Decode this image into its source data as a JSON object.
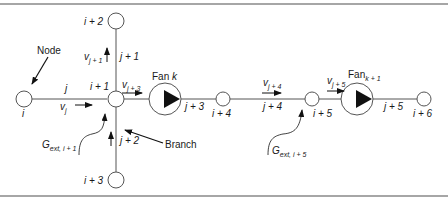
{
  "diagram": {
    "nodes": [
      {
        "id": "i",
        "label": "i"
      },
      {
        "id": "i+1",
        "label": "i + 1"
      },
      {
        "id": "i+2",
        "label": "i + 2"
      },
      {
        "id": "i+3",
        "label": "i + 3"
      },
      {
        "id": "i+4",
        "label": "i + 4"
      },
      {
        "id": "i+5",
        "label": "i + 5"
      },
      {
        "id": "i+6",
        "label": "i + 6"
      }
    ],
    "branches": [
      {
        "id": "j",
        "label": "j"
      },
      {
        "id": "j+1",
        "label": "j + 1"
      },
      {
        "id": "j+2",
        "label": "j + 2"
      },
      {
        "id": "j+3",
        "label": "j + 3"
      },
      {
        "id": "j+4",
        "label": "j + 4"
      },
      {
        "id": "j+5",
        "label": "j + 5"
      }
    ],
    "velocities": [
      {
        "base": "v",
        "sub": "j"
      },
      {
        "base": "v",
        "sub": "j + 1"
      },
      {
        "base": "v",
        "sub": "j + 3"
      },
      {
        "base": "v",
        "sub": "j + 4"
      },
      {
        "base": "v",
        "sub": "j + 5"
      }
    ],
    "fans": [
      {
        "base": "Fan ",
        "var": "k",
        "sub": ""
      },
      {
        "base": "Fan",
        "var": "",
        "sub": "k + 1"
      }
    ],
    "external_flows": [
      {
        "base": "G",
        "sub": "ext, i + 1"
      },
      {
        "base": "G",
        "sub": "ext, i + 5"
      }
    ],
    "annotations": {
      "node": "Node",
      "branch": "Branch"
    }
  }
}
